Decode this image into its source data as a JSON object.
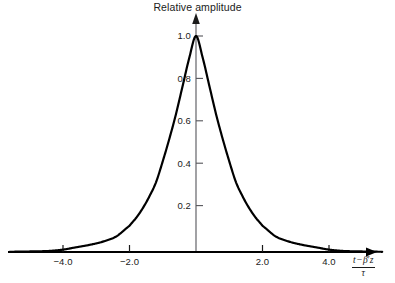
{
  "chart_data": {
    "type": "line",
    "title": "Relative amplitude",
    "xlabel_numerator_t": "t",
    "xlabel_numerator_op": "−",
    "xlabel_numerator_beta": "β",
    "xlabel_numerator_prime": "′",
    "xlabel_numerator_z": "z",
    "xlabel_denominator": "τ",
    "ylabel": "Relative amplitude",
    "xlim": [
      -5.6,
      5.6
    ],
    "ylim": [
      0,
      1.08
    ],
    "grid": false,
    "legend": "none",
    "xticks": [
      -4.0,
      -2.0,
      2.0,
      4.0
    ],
    "xtick_labels": [
      "−4.0",
      "−2.0",
      "2.0",
      "4.0"
    ],
    "yticks": [
      0.2,
      0.4,
      0.6,
      0.8,
      1.0
    ],
    "ytick_labels": [
      "0.2",
      "0.4",
      "0.6",
      "0.8",
      "1.0"
    ],
    "series": [
      {
        "name": "pulse",
        "description": "sech-squared soliton pulse envelope, peak 1.0 at 0",
        "color": "#000000",
        "x": [
          -5.6,
          -5.2,
          -4.8,
          -4.4,
          -4.0,
          -3.6,
          -3.2,
          -2.8,
          -2.4,
          -2.0,
          -1.8,
          -1.6,
          -1.4,
          -1.2,
          -1.0,
          -0.8,
          -0.6,
          -0.4,
          -0.2,
          0.0,
          0.2,
          0.4,
          0.6,
          0.8,
          1.0,
          1.2,
          1.4,
          1.6,
          1.8,
          2.0,
          2.4,
          2.8,
          3.2,
          3.6,
          4.0,
          4.4,
          4.8,
          5.2,
          5.6
        ],
        "values": [
          0.001,
          0.002,
          0.003,
          0.005,
          0.011,
          0.022,
          0.033,
          0.048,
          0.072,
          0.121,
          0.158,
          0.203,
          0.258,
          0.324,
          0.42,
          0.525,
          0.64,
          0.77,
          0.9,
          1.0,
          0.9,
          0.77,
          0.64,
          0.525,
          0.42,
          0.324,
          0.258,
          0.203,
          0.158,
          0.121,
          0.072,
          0.048,
          0.033,
          0.022,
          0.011,
          0.005,
          0.003,
          0.002,
          0.001
        ]
      }
    ],
    "axes": {
      "x_axis_color": "#000000",
      "y_axis_color": "#55555a",
      "curve_color": "#000000",
      "x_axis_arrow": true,
      "y_axis_arrow": true
    }
  }
}
